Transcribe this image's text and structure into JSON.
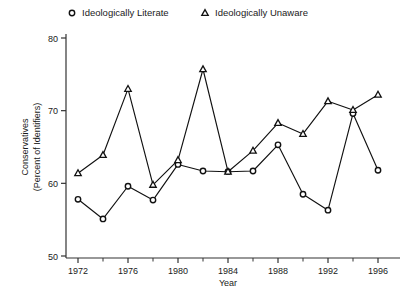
{
  "chart_data": {
    "type": "line",
    "title": "",
    "xlabel": "Year",
    "ylabel": "Conservatives\n(Percent of Identifiers)",
    "ylabel_line1": "Conservatives",
    "ylabel_line2": "(Percent of Identifiers)",
    "x": [
      1972,
      1974,
      1976,
      1978,
      1980,
      1982,
      1984,
      1986,
      1988,
      1990,
      1992,
      1994,
      1996
    ],
    "xlim": [
      1971,
      1997
    ],
    "ylim": [
      50,
      80
    ],
    "xticks": [
      1972,
      1976,
      1980,
      1984,
      1988,
      1992,
      1996
    ],
    "xticklabels": [
      "1972",
      "1976",
      "1980",
      "1984",
      "1988",
      "1992",
      "1996"
    ],
    "xminorticks": [
      1974,
      1978,
      1982,
      1986,
      1990,
      1994
    ],
    "yticks": [
      50,
      60,
      70,
      80
    ],
    "yticklabels": [
      "50",
      "60",
      "70",
      "80"
    ],
    "grid": false,
    "legend_position": "above-plot",
    "series": [
      {
        "name": "Ideologically Literate",
        "marker": "circle",
        "color": "#111111",
        "values": [
          57.8,
          55.1,
          59.6,
          57.7,
          62.6,
          61.7,
          61.6,
          61.7,
          65.3,
          58.5,
          56.3,
          69.6,
          61.8
        ]
      },
      {
        "name": "Ideologically Unaware",
        "marker": "triangle",
        "color": "#111111",
        "values": [
          61.4,
          63.9,
          73.0,
          59.8,
          63.2,
          75.7,
          61.6,
          64.5,
          68.3,
          66.8,
          71.3,
          70.1,
          72.2
        ]
      }
    ]
  },
  "legend": {
    "items": [
      {
        "marker": "circle",
        "label": "Ideologically Literate"
      },
      {
        "marker": "triangle",
        "label": "Ideologically Unaware"
      }
    ]
  }
}
